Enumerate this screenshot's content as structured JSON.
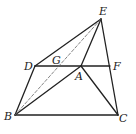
{
  "diagram": {
    "type": "geometry",
    "stroke_color": "#222222",
    "points": [
      {
        "id": "E",
        "label": "E",
        "x": 101,
        "y": 19,
        "lx": 99,
        "ly": 15
      },
      {
        "id": "D",
        "label": "D",
        "x": 35,
        "y": 66,
        "lx": 24,
        "ly": 70
      },
      {
        "id": "G",
        "label": "G",
        "x": 57,
        "y": 66,
        "lx": 52,
        "ly": 64
      },
      {
        "id": "A",
        "label": "A",
        "x": 81,
        "y": 66,
        "lx": 75,
        "ly": 80
      },
      {
        "id": "F",
        "label": "F",
        "x": 110,
        "y": 66,
        "lx": 113,
        "ly": 70
      },
      {
        "id": "B",
        "label": "B",
        "x": 15,
        "y": 115,
        "lx": 4,
        "ly": 120
      },
      {
        "id": "C",
        "label": "C",
        "x": 118,
        "y": 115,
        "lx": 119,
        "ly": 122
      }
    ],
    "segments": [
      {
        "from": "E",
        "to": "D",
        "style": "solid"
      },
      {
        "from": "D",
        "to": "B",
        "style": "solid"
      },
      {
        "from": "B",
        "to": "C",
        "style": "solid"
      },
      {
        "from": "C",
        "to": "E",
        "style": "solid"
      },
      {
        "from": "D",
        "to": "F",
        "style": "solid"
      },
      {
        "from": "E",
        "to": "A",
        "style": "solid"
      },
      {
        "from": "A",
        "to": "B",
        "style": "solid"
      },
      {
        "from": "A",
        "to": "C",
        "style": "solid"
      },
      {
        "from": "B",
        "to": "E",
        "style": "dashed"
      }
    ]
  }
}
